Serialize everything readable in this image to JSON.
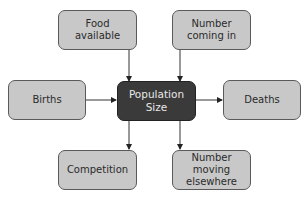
{
  "diagram": {
    "center": {
      "label_line1": "Population",
      "label_line2": "Size"
    },
    "nodes": {
      "food": {
        "line1": "Food",
        "line2": "available"
      },
      "coming_in": {
        "line1": "Number",
        "line2": "coming in"
      },
      "births": {
        "line1": "Births"
      },
      "deaths": {
        "line1": "Deaths"
      },
      "competition": {
        "line1": "Competition"
      },
      "moving": {
        "line1": "Number",
        "line2": "moving",
        "line3": "elsewhere"
      }
    },
    "edges": [
      {
        "from": "Food available",
        "to": "Population Size"
      },
      {
        "from": "Number coming in",
        "to": "Population Size"
      },
      {
        "from": "Births",
        "to": "Population Size"
      },
      {
        "from": "Population Size",
        "to": "Deaths"
      },
      {
        "from": "Population Size",
        "to": "Competition"
      },
      {
        "from": "Population Size",
        "to": "Number moving elsewhere"
      }
    ],
    "colors": {
      "node_fill": "#c8c8c8",
      "center_fill": "#3a3a3a",
      "border": "#5a5a5a"
    }
  }
}
